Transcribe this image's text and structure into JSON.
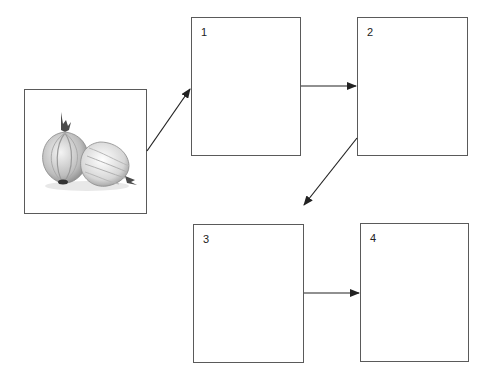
{
  "diagram": {
    "type": "sequence-flow",
    "image_box": {
      "icon": "onion-icon",
      "description": "two onions illustration"
    },
    "steps": [
      {
        "label": "1"
      },
      {
        "label": "2"
      },
      {
        "label": "3"
      },
      {
        "label": "4"
      }
    ],
    "connections": [
      {
        "from": "image",
        "to": "1"
      },
      {
        "from": "1",
        "to": "2"
      },
      {
        "from": "2",
        "to": "3"
      },
      {
        "from": "3",
        "to": "4"
      }
    ],
    "colors": {
      "border": "#5a5a5a",
      "arrow": "#222222",
      "background": "#ffffff"
    }
  }
}
